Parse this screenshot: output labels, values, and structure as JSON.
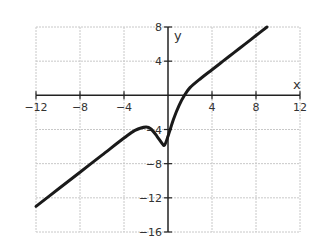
{
  "chart_data": {
    "type": "line",
    "title": "",
    "xlabel": "x",
    "ylabel": "y",
    "xlim": [
      -12,
      12
    ],
    "ylim": [
      -16,
      8
    ],
    "grid": true,
    "x_ticks": [
      -12,
      -8,
      -4,
      4,
      8,
      12
    ],
    "x_tick_labels": [
      "−12",
      "−8",
      "−4",
      "4",
      "8",
      "12"
    ],
    "y_ticks": [
      8,
      4,
      -4,
      -8,
      -12,
      -16
    ],
    "y_tick_labels": [
      "8",
      "4",
      "−4",
      "−8",
      "−12",
      "−16"
    ],
    "series": [
      {
        "name": "curve",
        "color": "#1a1a1a",
        "points": [
          [
            -12,
            -13.0
          ],
          [
            -10,
            -11.0
          ],
          [
            -8,
            -9.0
          ],
          [
            -6,
            -7.0
          ],
          [
            -4,
            -5.0
          ],
          [
            -3,
            -4.1
          ],
          [
            -2,
            -3.7
          ],
          [
            -1.5,
            -4.0
          ],
          [
            -1,
            -4.8
          ],
          [
            -0.5,
            -5.7
          ],
          [
            -0.3,
            -5.8
          ],
          [
            0,
            -4.8
          ],
          [
            0.5,
            -2.8
          ],
          [
            1,
            -1.2
          ],
          [
            1.5,
            0
          ],
          [
            2,
            0.9
          ],
          [
            3,
            2.0
          ],
          [
            4,
            3.0
          ],
          [
            5,
            4.0
          ],
          [
            6,
            5.0
          ],
          [
            7,
            6.0
          ],
          [
            8,
            7.0
          ],
          [
            9,
            8.0
          ]
        ]
      }
    ]
  }
}
